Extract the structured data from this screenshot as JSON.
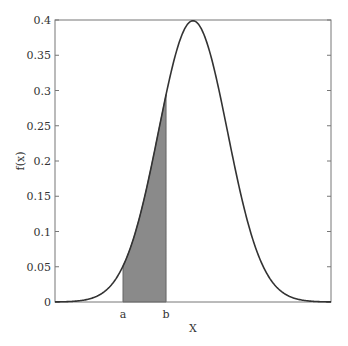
{
  "chart_data": {
    "type": "area",
    "title": "",
    "xlabel": "X",
    "ylabel": "f(x)",
    "xlim": [
      -4,
      4
    ],
    "ylim": [
      0,
      0.4
    ],
    "grid": false,
    "legend": null,
    "series": [
      {
        "name": "standard normal pdf",
        "mean": 0,
        "sd": 1,
        "peak": 0.399
      }
    ],
    "shaded_region": {
      "from_label": "a",
      "to_label": "b",
      "from_x": -2.03,
      "to_x": -0.78,
      "f_at_a": 0.05,
      "f_at_b": 0.295
    },
    "x_tick_labels": [
      "a",
      "b"
    ],
    "y_ticks": [
      0,
      0.05,
      0.1,
      0.15,
      0.2,
      0.25,
      0.3,
      0.35,
      0.4
    ],
    "y_tick_labels": [
      "0",
      "0.05",
      "0.1",
      "0.15",
      "0.2",
      "0.25",
      "0.3",
      "0.35",
      "0.4"
    ]
  },
  "colors": {
    "curve": "#333333",
    "shade": "#8a8a8a",
    "frame": "#777777"
  }
}
